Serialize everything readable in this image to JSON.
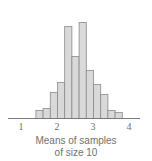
{
  "chart_data": {
    "type": "bar",
    "title": "",
    "xlabel": "Means of samples of size 10",
    "xlabel_lines": [
      "Means of samples",
      "of size 10"
    ],
    "ylabel": "",
    "bin_start": 1.4,
    "bin_width": 0.2,
    "categories": [
      "1.4-1.6",
      "1.6-1.8",
      "1.8-2.0",
      "2.0-2.2",
      "2.2-2.4",
      "2.4-2.6",
      "2.6-2.8",
      "2.8-3.0",
      "3.0-3.2",
      "3.2-3.4",
      "3.4-3.6",
      "3.6-3.8"
    ],
    "values": [
      4,
      5,
      13,
      18,
      46,
      31,
      48,
      24,
      17,
      12,
      4,
      3
    ],
    "xticks": [
      1,
      2,
      3,
      4
    ],
    "xlim": [
      0.6,
      4.3
    ],
    "ylim": [
      0,
      50
    ],
    "grid": false,
    "legend": null,
    "colors": {
      "bar_fill": "#d9d9d9",
      "bar_stroke": "#8a8a8a",
      "axis": "#7a7a7a",
      "text": "#6f6f6f"
    }
  }
}
